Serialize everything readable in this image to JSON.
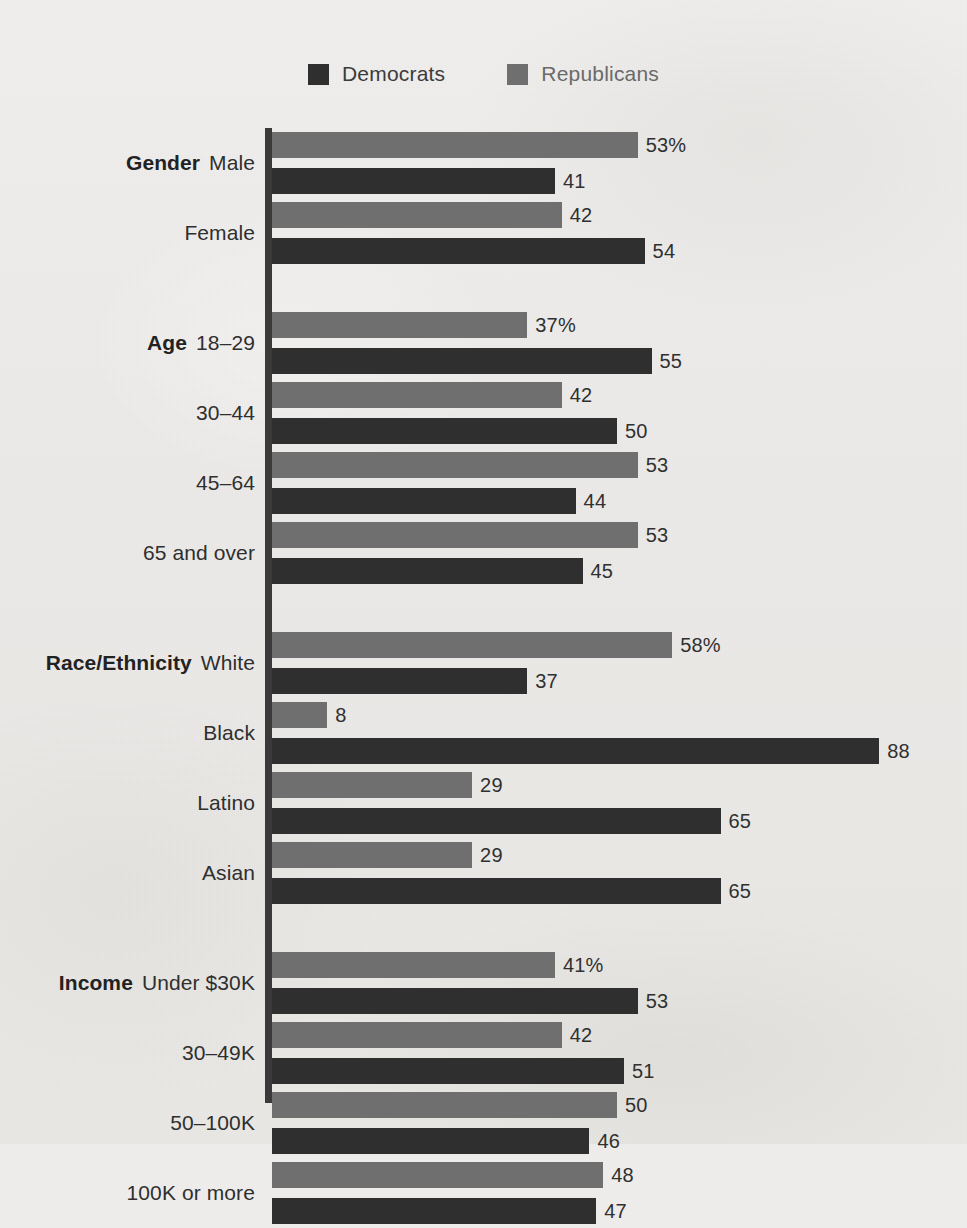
{
  "legend": {
    "items": [
      {
        "label": "Democrats",
        "color": "#2f2f2f",
        "icon": "square-swatch-icon"
      },
      {
        "label": "Republicans",
        "color": "#6f6f6f",
        "icon": "square-swatch-icon"
      }
    ]
  },
  "chart_data": {
    "type": "bar",
    "orientation": "horizontal",
    "title": "",
    "xlabel": "",
    "ylabel": "",
    "xlim": [
      0,
      100
    ],
    "grid": false,
    "legend_position": "top-center",
    "value_suffix_first_row_of_group": "%",
    "series": [
      {
        "name": "Republicans",
        "color": "#6f6f6f",
        "values": [
          53,
          42,
          37,
          42,
          53,
          53,
          58,
          8,
          29,
          29,
          41,
          42,
          50,
          48
        ]
      },
      {
        "name": "Democrats",
        "color": "#2f2f2f",
        "values": [
          41,
          54,
          55,
          50,
          44,
          45,
          37,
          88,
          65,
          65,
          53,
          51,
          46,
          47
        ]
      }
    ],
    "categories": [
      "Male",
      "Female",
      "18–29",
      "30–44",
      "45–64",
      "65 and over",
      "White",
      "Black",
      "Latino",
      "Asian",
      "Under $30K",
      "30–49K",
      "50–100K",
      "100K or more"
    ],
    "groups": [
      {
        "group_label": "Gender",
        "rows": [
          {
            "label": "Male",
            "republicans": 53,
            "democrats": 41,
            "rep_display": "53%",
            "dem_display": "41"
          },
          {
            "label": "Female",
            "republicans": 42,
            "democrats": 54,
            "rep_display": "42",
            "dem_display": "54"
          }
        ]
      },
      {
        "group_label": "Age",
        "rows": [
          {
            "label": "18–29",
            "republicans": 37,
            "democrats": 55,
            "rep_display": "37%",
            "dem_display": "55"
          },
          {
            "label": "30–44",
            "republicans": 42,
            "democrats": 50,
            "rep_display": "42",
            "dem_display": "50"
          },
          {
            "label": "45–64",
            "republicans": 53,
            "democrats": 44,
            "rep_display": "53",
            "dem_display": "44"
          },
          {
            "label": "65 and over",
            "republicans": 53,
            "democrats": 45,
            "rep_display": "53",
            "dem_display": "45"
          }
        ]
      },
      {
        "group_label": "Race/Ethnicity",
        "rows": [
          {
            "label": "White",
            "republicans": 58,
            "democrats": 37,
            "rep_display": "58%",
            "dem_display": "37"
          },
          {
            "label": "Black",
            "republicans": 8,
            "democrats": 88,
            "rep_display": "8",
            "dem_display": "88"
          },
          {
            "label": "Latino",
            "republicans": 29,
            "democrats": 65,
            "rep_display": "29",
            "dem_display": "65"
          },
          {
            "label": "Asian",
            "republicans": 29,
            "democrats": 65,
            "rep_display": "29",
            "dem_display": "65"
          }
        ]
      },
      {
        "group_label": "Income",
        "rows": [
          {
            "label": "Under $30K",
            "republicans": 41,
            "democrats": 53,
            "rep_display": "41%",
            "dem_display": "53"
          },
          {
            "label": "30–49K",
            "republicans": 42,
            "democrats": 51,
            "rep_display": "42",
            "dem_display": "51"
          },
          {
            "label": "50–100K",
            "republicans": 50,
            "democrats": 46,
            "rep_display": "50",
            "dem_display": "46"
          },
          {
            "label": "100K or more",
            "republicans": 48,
            "democrats": 47,
            "rep_display": "48",
            "dem_display": "47"
          }
        ]
      }
    ]
  },
  "render": {
    "px_per_unit": 6.9
  }
}
